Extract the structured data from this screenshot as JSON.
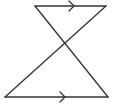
{
  "diagram": {
    "stroke_color": "#333333",
    "background": "#ffffff",
    "segments": [
      {
        "name": "top-parallel-line",
        "x1": 35,
        "y1": 6,
        "x2": 106,
        "y2": 6
      },
      {
        "name": "bottom-parallel-line",
        "x1": 5,
        "y1": 97,
        "x2": 108,
        "y2": 97
      },
      {
        "name": "transversal-left-to-right",
        "x1": 35,
        "y1": 6,
        "x2": 108,
        "y2": 97
      },
      {
        "name": "transversal-right-to-left",
        "x1": 106,
        "y1": 6,
        "x2": 5,
        "y2": 97
      }
    ],
    "parallel_markers": [
      {
        "name": "top-parallel-arrow",
        "tip_x": 74,
        "y": 6
      },
      {
        "name": "bottom-parallel-arrow",
        "tip_x": 65,
        "y": 97
      }
    ]
  }
}
